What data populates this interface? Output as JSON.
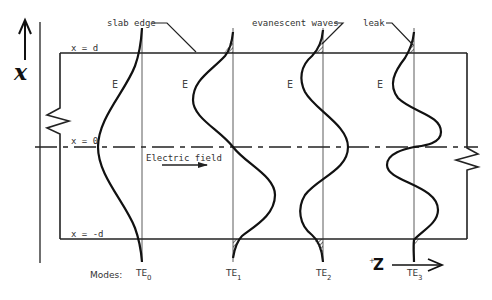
{
  "diagram": {
    "axis_label_x": "x",
    "axis_label_z": "Z",
    "axis_label_z_prefix": "+",
    "labels": {
      "slab_edge": "slab edge",
      "evanescent_waves": "evanescent waves",
      "leak": "leak",
      "x_eq_d": "x = d",
      "x_eq_0": "x = 0",
      "x_eq_neg_d": "x = -d",
      "electric_field": "Electric field",
      "modes": "Modes:"
    },
    "field_symbol": "E",
    "modes": [
      {
        "name": "TE",
        "sub": "0"
      },
      {
        "name": "TE",
        "sub": "1"
      },
      {
        "name": "TE",
        "sub": "2"
      },
      {
        "name": "TE",
        "sub": "3"
      }
    ]
  }
}
